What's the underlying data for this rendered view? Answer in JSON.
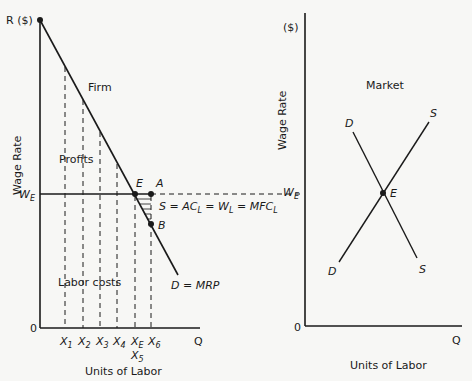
{
  "firm": {
    "panel_title": "Firm",
    "y_axis_top_label": "R ($)",
    "y_axis_title": "Wage Rate",
    "x_axis_title": "Units of Labor",
    "origin": "0",
    "x_axis_end": "Q",
    "wage_label": "W",
    "wage_sub": "E",
    "profits_label": "Profits",
    "labor_costs_label": "Labor costs",
    "demand_label": "D = MRP",
    "supply_label_parts": {
      "s": "S = AC",
      "l1": "L",
      "w": " = W",
      "l2": "L",
      "mfc": " = MFC",
      "l3": "L"
    },
    "point_e": "E",
    "point_a": "A",
    "point_b": "B",
    "x_ticks": [
      {
        "main": "X",
        "sub": "1"
      },
      {
        "main": "X",
        "sub": "2"
      },
      {
        "main": "X",
        "sub": "3"
      },
      {
        "main": "X",
        "sub": "4"
      },
      {
        "main": "X",
        "sub": "E"
      },
      {
        "main": "X",
        "sub": "6"
      }
    ],
    "x5_label": {
      "main": "X",
      "sub": "5"
    }
  },
  "market": {
    "panel_title": "Market",
    "y_axis_top_label": "($)",
    "y_axis_title": "Wage Rate",
    "x_axis_title": "Units of Labor",
    "origin": "0",
    "x_axis_end": "Q",
    "wage_label": "W",
    "wage_sub": "E",
    "point_e": "E",
    "demand_top": "D",
    "demand_bottom": "D",
    "supply_top": "S",
    "supply_bottom": "S"
  },
  "colors": {
    "ink": "#1a1a1a",
    "background": "#f7f7f5"
  }
}
